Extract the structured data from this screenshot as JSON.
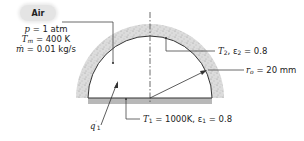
{
  "figure": {
    "air_label": "Air",
    "air_properties": [
      {
        "symbol": "p",
        "sub": "",
        "value": "= 1 atm"
      },
      {
        "symbol": "T",
        "sub": "m",
        "value": "= 400 K"
      },
      {
        "symbol": "ṁ",
        "sub": "",
        "value": "= 0.01 kg/s"
      }
    ],
    "dome_label": {
      "symbol": "T",
      "sub": "2",
      "rest": ", ε",
      "eps_sub": "2",
      "value": " = 0.8"
    },
    "radius_label": {
      "symbol": "r",
      "sub": "o",
      "value": " = 20 mm"
    },
    "base_label": {
      "symbol": "T",
      "sub": "1",
      "mid": " = 1000K, ε",
      "eps_sub": "1",
      "value": " = 0.8"
    },
    "heat_label": {
      "symbol": "q",
      "sup": "′",
      "sub": "1"
    },
    "colors": {
      "insulation": "#d9d9d9",
      "base_plate": "#b8b8b8",
      "line": "#333333"
    }
  }
}
